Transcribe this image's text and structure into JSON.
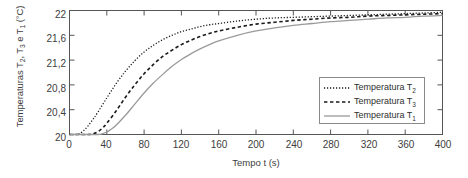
{
  "chart_data": {
    "type": "line",
    "title": "",
    "xlabel": "Tempo t (s)",
    "ylabel": "Temperaturas T2, T3 e T1 (°C)",
    "ylabel_parts": {
      "prefix": "Temperaturas T",
      "sub1": "2",
      "mid1": ", T",
      "sub2": "3",
      "mid2": " e T",
      "sub3": "1",
      "suffix": " (°C)"
    },
    "xlim": [
      0,
      400
    ],
    "ylim": [
      20,
      22
    ],
    "xticks": [
      0,
      40,
      80,
      120,
      160,
      200,
      240,
      280,
      320,
      360,
      400
    ],
    "xticklabels": [
      "0",
      "40",
      "80",
      "120",
      "160",
      "200",
      "240",
      "280",
      "320",
      "360",
      "400"
    ],
    "yticks": [
      20,
      20.4,
      20.8,
      21.2,
      21.6,
      22
    ],
    "yticklabels": [
      "20",
      "20,4",
      "20,8",
      "21,2",
      "21,6",
      "22"
    ],
    "grid": false,
    "legend_position": "lower right",
    "series": [
      {
        "name": "Temperatura T2",
        "label_prefix": "Temperatura T",
        "label_sub": "2",
        "style": "dotted",
        "color": "#1a1a1a",
        "x": [
          0,
          5,
          10,
          15,
          20,
          25,
          30,
          40,
          50,
          60,
          70,
          80,
          90,
          100,
          110,
          120,
          130,
          140,
          150,
          160,
          180,
          200,
          220,
          240,
          260,
          280,
          300,
          320,
          340,
          360,
          380,
          400
        ],
        "y": [
          20.0,
          20.0,
          20.01,
          20.06,
          20.14,
          20.24,
          20.35,
          20.59,
          20.82,
          21.02,
          21.19,
          21.33,
          21.44,
          21.53,
          21.6,
          21.66,
          21.7,
          21.74,
          21.77,
          21.79,
          21.83,
          21.86,
          21.88,
          21.89,
          21.9,
          21.91,
          21.92,
          21.93,
          21.94,
          21.95,
          21.96,
          21.97
        ]
      },
      {
        "name": "Temperatura T3",
        "label_prefix": "Temperatura T",
        "label_sub": "3",
        "style": "dashed",
        "color": "#1a1a1a",
        "x": [
          0,
          10,
          20,
          25,
          30,
          35,
          40,
          50,
          60,
          70,
          80,
          90,
          100,
          110,
          120,
          130,
          140,
          150,
          160,
          180,
          200,
          220,
          240,
          260,
          280,
          300,
          320,
          340,
          360,
          380,
          400
        ],
        "y": [
          20.0,
          20.0,
          20.0,
          20.01,
          20.04,
          20.1,
          20.18,
          20.38,
          20.6,
          20.8,
          20.98,
          21.13,
          21.26,
          21.36,
          21.45,
          21.52,
          21.58,
          21.63,
          21.67,
          21.73,
          21.78,
          21.81,
          21.84,
          21.86,
          21.88,
          21.89,
          21.91,
          21.92,
          21.93,
          21.94,
          21.95
        ]
      },
      {
        "name": "Temperatura T1",
        "label_prefix": "Temperatura T",
        "label_sub": "1",
        "style": "solid",
        "color": "#9a9a9a",
        "x": [
          0,
          10,
          20,
          30,
          35,
          40,
          45,
          50,
          60,
          70,
          80,
          90,
          100,
          110,
          120,
          130,
          140,
          150,
          160,
          180,
          200,
          220,
          240,
          260,
          280,
          300,
          320,
          340,
          360,
          380,
          400
        ],
        "y": [
          20.0,
          20.0,
          20.0,
          20.0,
          20.01,
          20.04,
          20.09,
          20.15,
          20.31,
          20.49,
          20.67,
          20.83,
          20.97,
          21.1,
          21.21,
          21.3,
          21.38,
          21.45,
          21.51,
          21.6,
          21.67,
          21.72,
          21.76,
          21.79,
          21.82,
          21.84,
          21.86,
          21.88,
          21.89,
          21.91,
          21.92
        ]
      }
    ]
  },
  "axes": {
    "frame_color": "#555555",
    "background": "#ffffff"
  }
}
